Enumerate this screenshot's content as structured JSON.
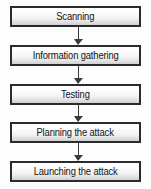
{
  "diagram": {
    "type": "flowchart",
    "orientation": "vertical-top-to-bottom",
    "background_color": "#fdfdfd",
    "box_border_color": "#2b2b2b",
    "box_fill_top_color": "#ffffff",
    "box_fill_bottom_color": "#cfcfcf",
    "arrow_color": "#3a3a3a",
    "text_color": "#141414",
    "steps": [
      {
        "label": "Scanning"
      },
      {
        "label": "Information gathering"
      },
      {
        "label": "Testing"
      },
      {
        "label": "Planning the attack"
      },
      {
        "label": "Launching the attack"
      }
    ],
    "connectors": [
      {
        "from": "Scanning",
        "to": "Information gathering",
        "glyph": "arrow-down-icon"
      },
      {
        "from": "Information gathering",
        "to": "Testing",
        "glyph": "arrow-down-icon"
      },
      {
        "from": "Testing",
        "to": "Planning the attack",
        "glyph": "arrow-down-icon"
      },
      {
        "from": "Planning the attack",
        "to": "Launching the attack",
        "glyph": "arrow-down-icon"
      }
    ]
  }
}
